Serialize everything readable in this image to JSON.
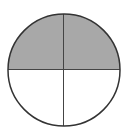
{
  "diagram": {
    "type": "fraction-circle",
    "parts_total": 4,
    "parts_shaded": 2,
    "colors": {
      "shaded": "#a8a8a8",
      "unshaded": "#ffffff",
      "outline": "#333333",
      "divider": "#444444"
    }
  }
}
